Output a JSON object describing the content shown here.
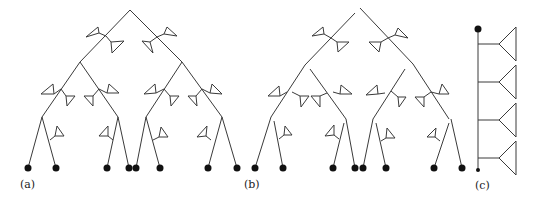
{
  "figure": {
    "panels": [
      {
        "id": "a",
        "label": "(a)",
        "description": "Complete binary tree with triangular flags on edges and filled leaf nodes"
      },
      {
        "id": "b",
        "label": "(b)",
        "description": "Same tree with edges disconnected at branch points"
      },
      {
        "id": "c",
        "label": "(c)",
        "description": "Linear chain (spine) with four side branches ending in triangles"
      }
    ],
    "colors": {
      "stroke": "#3a3a3a",
      "node": "#111111",
      "background": "#ffffff"
    },
    "leaf_count": {
      "a": 8,
      "b": 8,
      "c": 2
    },
    "flag_count": {
      "a": 12,
      "b": 12,
      "c": 4
    }
  }
}
